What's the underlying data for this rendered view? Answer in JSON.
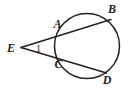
{
  "figure": {
    "type": "geometry-diagram",
    "background_color": "#ffffff",
    "stroke_color": "#231f20",
    "canvas": {
      "width": 133,
      "height": 89
    }
  },
  "circle": {
    "name": "circle",
    "center_x": 87,
    "center_y": 46,
    "radius": 32.5,
    "stroke_width": 1.5
  },
  "vertex": {
    "name": "E",
    "x": 21,
    "y": 47.5
  },
  "secants": [
    {
      "name": "secant-EAB",
      "from": "E",
      "near_point": "A",
      "far_point": "B",
      "x1": 21,
      "y1": 47.5,
      "x2": 111,
      "y2": 19.5
    },
    {
      "name": "secant-ECD",
      "from": "E",
      "near_point": "C",
      "far_point": "D",
      "x1": 21,
      "y1": 47.5,
      "x2": 106.5,
      "y2": 73
    }
  ],
  "labels": [
    {
      "id": "E",
      "text": "E",
      "x": 11,
      "y": 51.5,
      "anchor": "middle",
      "kind": "point"
    },
    {
      "id": "A",
      "text": "A",
      "x": 57.5,
      "y": 28,
      "anchor": "middle",
      "kind": "point"
    },
    {
      "id": "B",
      "text": "B",
      "x": 112,
      "y": 13,
      "anchor": "middle",
      "kind": "point"
    },
    {
      "id": "C",
      "text": "C",
      "x": 58.5,
      "y": 68,
      "anchor": "middle",
      "kind": "point"
    },
    {
      "id": "D",
      "text": "D",
      "x": 107,
      "y": 84,
      "anchor": "middle",
      "kind": "point"
    },
    {
      "id": "angle1",
      "text": "1",
      "x": 38.5,
      "y": 52,
      "anchor": "middle",
      "kind": "angle"
    }
  ]
}
